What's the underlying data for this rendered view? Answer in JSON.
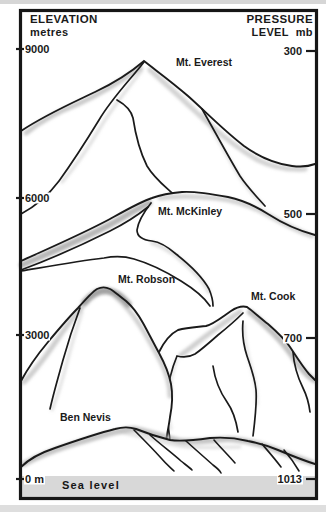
{
  "page": {
    "background": "#ffffff",
    "top_bar_color": "#d6d6d6",
    "bottom_bar_color": "#dedede",
    "ink_color": "#1a1a1a",
    "frame_color": "#161616"
  },
  "axes": {
    "left": {
      "title": "ELEVATION",
      "subtitle": "metres",
      "ticks": [
        {
          "label": "9000",
          "y": 49
        },
        {
          "label": "6000",
          "y": 198
        },
        {
          "label": "3000",
          "y": 335
        },
        {
          "label": "0 m",
          "y": 479
        }
      ]
    },
    "right": {
      "title": "PRESSURE",
      "subtitle": "LEVEL  mb",
      "ticks": [
        {
          "label": "300",
          "y": 51
        },
        {
          "label": "500",
          "y": 214
        },
        {
          "label": "700",
          "y": 338
        },
        {
          "label": "1013",
          "y": 479
        }
      ]
    }
  },
  "mountains": [
    {
      "name": "Mt. Everest",
      "label_x": 176,
      "label_y": 57
    },
    {
      "name": "Mt. McKinley",
      "label_x": 158,
      "label_y": 206
    },
    {
      "name": "Mt. Robson",
      "label_x": 118,
      "label_y": 274
    },
    {
      "name": "Mt. Cook",
      "label_x": 251,
      "label_y": 291
    },
    {
      "name": "Ben Nevis",
      "label_x": 60,
      "label_y": 412
    }
  ],
  "sea": {
    "label": "Sea level",
    "label_x": 62,
    "label_y": 480,
    "color": "#d8d8d8"
  }
}
